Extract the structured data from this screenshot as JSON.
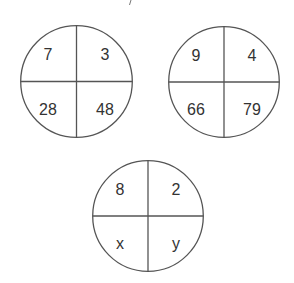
{
  "puzzle": {
    "circles": [
      {
        "id": "circle-1",
        "cx": 76,
        "cy": 81,
        "r": 57,
        "quadrants": {
          "top_left": "7",
          "top_right": "3",
          "bottom_left": "28",
          "bottom_right": "48"
        }
      },
      {
        "id": "circle-2",
        "cx": 224,
        "cy": 82,
        "r": 56,
        "quadrants": {
          "top_left": "9",
          "top_right": "4",
          "bottom_left": "66",
          "bottom_right": "79"
        }
      },
      {
        "id": "circle-3",
        "cx": 148,
        "cy": 216,
        "r": 56,
        "quadrants": {
          "top_left": "8",
          "top_right": "2",
          "bottom_left": "x",
          "bottom_right": "y"
        }
      }
    ],
    "colors": {
      "stroke": "#555555",
      "text": "#333333",
      "background": "#ffffff"
    }
  }
}
